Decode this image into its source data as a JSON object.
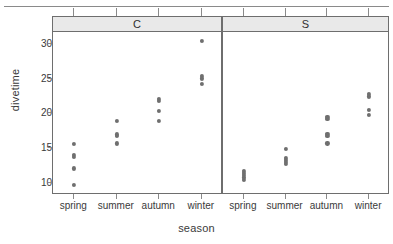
{
  "chart_data": {
    "type": "scatter",
    "plot_style": "lattice-stripplot",
    "title": "",
    "xlabel": "season",
    "ylabel": "divetime",
    "categories": [
      "spring",
      "summer",
      "autumn",
      "winter"
    ],
    "ylim": [
      8.2,
      31.6
    ],
    "yticks": [
      10,
      15,
      20,
      25,
      30
    ],
    "ytick_labels": [
      "10",
      "15",
      "20",
      "25",
      "30"
    ],
    "grid": false,
    "legend": null,
    "panel_variable": "site",
    "panels": [
      {
        "label": "C",
        "groups": [
          {
            "category": "spring",
            "values": [
              15.4,
              13.9,
              13.6,
              11.9,
              9.5
            ]
          },
          {
            "category": "summer",
            "values": [
              18.7,
              16.8,
              16.6,
              15.5
            ]
          },
          {
            "category": "autumn",
            "values": [
              21.9,
              21.6,
              20.2,
              18.7
            ]
          },
          {
            "category": "winter",
            "values": [
              30.3,
              25.3,
              24.9,
              24.1
            ]
          }
        ]
      },
      {
        "label": "S",
        "groups": [
          {
            "category": "spring",
            "values": [
              11.5,
              11.2,
              10.9,
              10.6,
              10.2
            ]
          },
          {
            "category": "summer",
            "values": [
              14.7,
              13.4,
              13.1,
              12.8,
              12.5
            ]
          },
          {
            "category": "autumn",
            "values": [
              19.3,
              19.0,
              16.9,
              16.6,
              15.5
            ]
          },
          {
            "category": "winter",
            "values": [
              22.6,
              22.3,
              20.4,
              19.6
            ]
          }
        ]
      }
    ]
  }
}
